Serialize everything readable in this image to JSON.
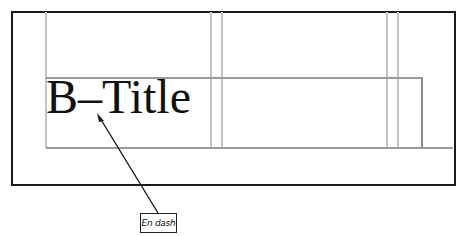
{
  "diagram": {
    "title_text": "B–Title",
    "annotation": {
      "label": "En dash",
      "target": "en-dash character in title"
    },
    "colors": {
      "frame": "#1a1a1a",
      "guides": "#c4c4c4",
      "box": "#9a9a9a",
      "text": "#111111"
    }
  }
}
